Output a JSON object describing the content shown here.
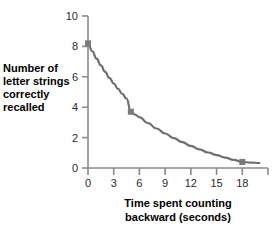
{
  "chart_data": {
    "type": "line",
    "title": "",
    "xlabel": "Time spent counting backward (seconds)",
    "ylabel": "Number of letter strings correctly recalled",
    "xlabel_lines": [
      "Time spent counting",
      "backward (seconds)"
    ],
    "ylabel_lines": [
      "Number of",
      "letter strings",
      "correctly",
      "recalled"
    ],
    "xlim": [
      0,
      21
    ],
    "ylim": [
      0,
      10
    ],
    "xticks": [
      0,
      3,
      6,
      9,
      12,
      15,
      18,
      21
    ],
    "xtick_labels": [
      "0",
      "3",
      "6",
      "9",
      "12",
      "15",
      "18",
      ""
    ],
    "yticks": [
      0,
      2,
      4,
      6,
      8,
      10
    ],
    "ytick_labels": [
      "0",
      "2",
      "4",
      "6",
      "8",
      "10"
    ],
    "grid": false,
    "legend": false,
    "x": [
      0,
      5,
      18
    ],
    "y": [
      8.2,
      3.7,
      0.4
    ],
    "markers": [
      {
        "x": 0,
        "y": 8.2
      },
      {
        "x": 5,
        "y": 3.7
      },
      {
        "x": 18,
        "y": 0.4
      }
    ],
    "curve": [
      {
        "x": 0.0,
        "y": 8.2
      },
      {
        "x": 0.5,
        "y": 7.68
      },
      {
        "x": 1.0,
        "y": 7.2
      },
      {
        "x": 1.5,
        "y": 6.75
      },
      {
        "x": 2.0,
        "y": 6.33
      },
      {
        "x": 2.5,
        "y": 5.93
      },
      {
        "x": 3.0,
        "y": 5.56
      },
      {
        "x": 3.5,
        "y": 5.21
      },
      {
        "x": 4.0,
        "y": 4.88
      },
      {
        "x": 4.5,
        "y": 4.57
      },
      {
        "x": 5.0,
        "y": 3.7
      },
      {
        "x": 5.5,
        "y": 3.51
      },
      {
        "x": 6.0,
        "y": 3.35
      },
      {
        "x": 7.0,
        "y": 2.95
      },
      {
        "x": 8.0,
        "y": 2.6
      },
      {
        "x": 9.0,
        "y": 2.27
      },
      {
        "x": 10.0,
        "y": 1.97
      },
      {
        "x": 11.0,
        "y": 1.7
      },
      {
        "x": 12.0,
        "y": 1.45
      },
      {
        "x": 13.0,
        "y": 1.22
      },
      {
        "x": 14.0,
        "y": 1.02
      },
      {
        "x": 15.0,
        "y": 0.85
      },
      {
        "x": 16.0,
        "y": 0.68
      },
      {
        "x": 17.0,
        "y": 0.53
      },
      {
        "x": 18.0,
        "y": 0.4
      },
      {
        "x": 19.0,
        "y": 0.36
      },
      {
        "x": 20.0,
        "y": 0.33
      }
    ],
    "series_color": "#6e6e6e",
    "marker_color": "#7a7a7a",
    "axis_color": "#8a8a8a",
    "text_color": "#000000"
  }
}
